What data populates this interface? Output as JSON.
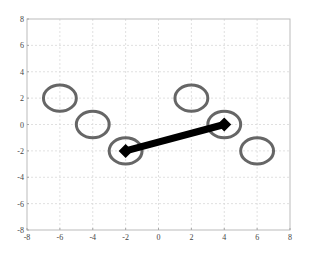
{
  "chart_data": {
    "type": "scatter",
    "title": "",
    "xlabel": "",
    "ylabel": "",
    "xlim": [
      -8,
      8
    ],
    "ylim": [
      -8,
      8
    ],
    "grid": true,
    "xticks": [
      -8,
      -6,
      -4,
      -2,
      0,
      2,
      4,
      6,
      8
    ],
    "yticks": [
      -8,
      -6,
      -4,
      -2,
      0,
      2,
      4,
      6,
      8
    ],
    "series": [
      {
        "name": "ellipses",
        "marker": "ellipse",
        "color": "#555555",
        "points": [
          {
            "x": -6,
            "y": 2
          },
          {
            "x": -4,
            "y": 0
          },
          {
            "x": -2,
            "y": -2
          },
          {
            "x": 2,
            "y": 2
          },
          {
            "x": 4,
            "y": 0
          },
          {
            "x": 6,
            "y": -2
          }
        ],
        "rx": 1.0,
        "ry": 1.0
      },
      {
        "name": "segment",
        "marker": "diamond",
        "color": "#000000",
        "points": [
          {
            "x": -2,
            "y": -2
          },
          {
            "x": 4,
            "y": 0
          }
        ]
      }
    ]
  },
  "colors": {
    "axis": "#bbbbbb",
    "grid": "#d8d8d8",
    "ellipse": "#555555",
    "line": "#000000"
  }
}
